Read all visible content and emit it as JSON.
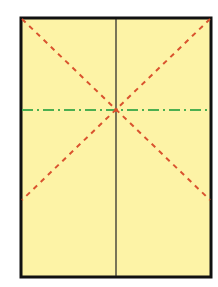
{
  "diagram": {
    "type": "paper-fold-crease-diagram",
    "paper": {
      "fill": "#fdf3a6",
      "border_color": "#111111",
      "x": 21,
      "y": 18,
      "width": 190,
      "height": 259
    },
    "center": {
      "x": 116,
      "y": 110
    },
    "lines": [
      {
        "id": "diagonal-tl",
        "kind": "valley-fold",
        "style": "dashed",
        "color": "#d9532e",
        "x1": 22,
        "y1": 19,
        "x2": 210,
        "y2": 200
      },
      {
        "id": "diagonal-tr",
        "kind": "valley-fold",
        "style": "dashed",
        "color": "#d9532e",
        "x1": 210,
        "y1": 19,
        "x2": 22,
        "y2": 200
      },
      {
        "id": "horizontal",
        "kind": "mountain-fold",
        "style": "dash-dot",
        "color": "#4caf50",
        "x1": 22,
        "y1": 110,
        "x2": 210,
        "y2": 110
      },
      {
        "id": "vertical",
        "kind": "crease",
        "style": "solid",
        "color": "#222222",
        "x1": 116,
        "y1": 19,
        "x2": 116,
        "y2": 276
      }
    ]
  }
}
